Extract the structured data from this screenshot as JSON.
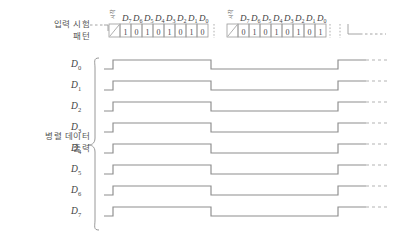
{
  "figure": {
    "type": "timing-diagram",
    "title_left_input": "입력 시험\n패턴",
    "title_left_output": "병렬 데이터\n출력"
  },
  "labels": {
    "input_test_pattern_line1": "입력 시험",
    "input_test_pattern_line2": "패턴",
    "parallel_data_output_line1": "병렬 데이터",
    "parallel_data_output_line2": "출력",
    "start_marker": "시작"
  },
  "serial_header": {
    "bit_names": [
      "D",
      "D",
      "D",
      "D",
      "D",
      "D",
      "D",
      "D"
    ],
    "bit_subscripts": [
      "7",
      "6",
      "5",
      "4",
      "3",
      "2",
      "1",
      "0"
    ]
  },
  "frames": [
    {
      "name": "frame-1",
      "start_label": "시작",
      "bits": [
        "1",
        "0",
        "1",
        "0",
        "1",
        "0",
        "1",
        "0"
      ]
    },
    {
      "name": "frame-2",
      "start_label": "시작",
      "bits": [
        "0",
        "1",
        "0",
        "1",
        "0",
        "1",
        "0",
        "1"
      ]
    }
  ],
  "outputs": {
    "signal_base": "D",
    "signals": [
      {
        "name": "D",
        "subscript": "0",
        "levels": [
          1,
          0,
          1
        ]
      },
      {
        "name": "D",
        "subscript": "1",
        "levels": [
          1,
          0,
          1
        ]
      },
      {
        "name": "D",
        "subscript": "2",
        "levels": [
          1,
          0,
          1
        ]
      },
      {
        "name": "D",
        "subscript": "3",
        "levels": [
          1,
          0,
          1
        ]
      },
      {
        "name": "D",
        "subscript": "4",
        "levels": [
          1,
          0,
          1
        ]
      },
      {
        "name": "D",
        "subscript": "5",
        "levels": [
          1,
          0,
          1
        ]
      },
      {
        "name": "D",
        "subscript": "6",
        "levels": [
          1,
          0,
          1
        ]
      },
      {
        "name": "D",
        "subscript": "7",
        "levels": [
          1,
          0,
          1
        ]
      }
    ]
  },
  "colors": {
    "background": "#ffffff",
    "line": "#8d8d8d",
    "cell_border": "#9a9a9a",
    "text": "#4a4a4a",
    "dash": "#b4b4b4"
  }
}
